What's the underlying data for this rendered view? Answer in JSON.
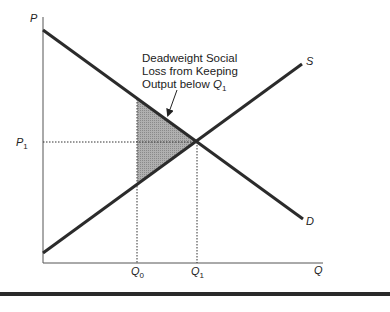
{
  "diagram": {
    "axes": {
      "y_label": "P",
      "x_label": "Q"
    },
    "curves": {
      "supply": {
        "label": "S"
      },
      "demand": {
        "label": "D"
      }
    },
    "markers": {
      "p1": {
        "label": "P",
        "subscript": "1"
      },
      "q0": {
        "label": "Q",
        "subscript": "0"
      },
      "q1": {
        "label": "Q",
        "subscript": "1"
      }
    },
    "annotation": {
      "line1": "Deadweight Social",
      "line2": "Loss from Keeping",
      "line3_prefix": "Output below ",
      "line3_var": "Q",
      "line3_sub": "1"
    },
    "colors": {
      "line": "#2b2b2b",
      "shade": "#9a9a9a",
      "axis": "#555555"
    }
  }
}
